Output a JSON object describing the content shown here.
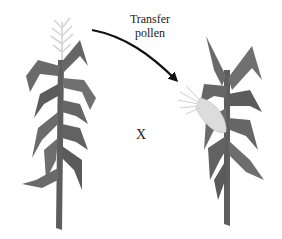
{
  "diagram": {
    "arrow_label_line1": "Transfer",
    "arrow_label_line2": "pollen",
    "cross_symbol": "X",
    "left_plant": "corn-plant-with-tassel",
    "right_plant": "corn-plant-with-ear-and-silk",
    "colors": {
      "leaf": "#6e6e6e",
      "leaf_dark": "#5a5a5a",
      "tassel": "#d8d8d8",
      "ear": "#dcdcdc",
      "arrow": "#111111",
      "background": "#ffffff"
    }
  }
}
